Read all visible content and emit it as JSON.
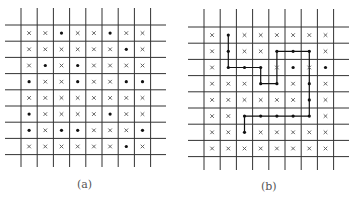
{
  "panels": [
    {
      "id": "a",
      "caption": "(a)",
      "rows": 8,
      "cols": 8,
      "cells": [
        "xx•xx•xx",
        "xxxxxx•x",
        "x•x•xxxx",
        "•xx•xx••",
        "xxxxxxxx",
        "•xxxx•xx",
        "•x••xxx•",
        "xxxxxx•x"
      ],
      "path": []
    },
    {
      "id": "b",
      "caption": "(b)",
      "rows": 8,
      "cols": 8,
      "cells": [
        "x•xxxxxx",
        "x•xx•••x",
        "x•••x•x•",
        "xxx••x•x",
        "xxxxxx•x",
        "xx•••••x",
        "xx•xxxxx",
        "xxxxxxxx"
      ],
      "path": [
        [
          1,
          0
        ],
        [
          1,
          1
        ],
        [
          1,
          2
        ],
        [
          2,
          2
        ],
        [
          3,
          2
        ],
        [
          3,
          3
        ],
        [
          4,
          3
        ],
        [
          4,
          2
        ],
        [
          4,
          1
        ],
        [
          5,
          1
        ],
        [
          6,
          1
        ],
        [
          6,
          2
        ],
        [
          6,
          3
        ],
        [
          6,
          4
        ],
        [
          6,
          5
        ],
        [
          5,
          5
        ],
        [
          4,
          5
        ],
        [
          3,
          5
        ],
        [
          2,
          5
        ],
        [
          2,
          6
        ]
      ]
    }
  ],
  "symbols": {
    "empty": "cross-mark",
    "occupied": "dot"
  },
  "colors": {
    "line": "#333333",
    "mark": "#555555",
    "dot": "#111111",
    "path": "#111111"
  }
}
